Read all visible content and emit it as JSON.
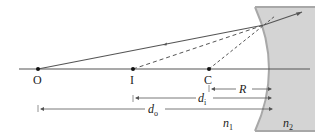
{
  "diagram": {
    "points": [
      {
        "id": "O",
        "label": "O",
        "x": 38
      },
      {
        "id": "I",
        "label": "I",
        "x": 133
      },
      {
        "id": "C",
        "label": "C",
        "x": 209
      }
    ],
    "dimensions": {
      "R": {
        "label": "R"
      },
      "di": {
        "label": "d",
        "sub": "i"
      },
      "do": {
        "label": "d",
        "sub": "o"
      }
    },
    "media": {
      "n1": {
        "label": "n",
        "sub": "1"
      },
      "n2": {
        "label": "n",
        "sub": "2"
      }
    },
    "colors": {
      "medium2_fill": "#d4d4d4",
      "medium2_edge": "#a8a8a8",
      "ray": "#555555",
      "axis": "#555555"
    }
  }
}
